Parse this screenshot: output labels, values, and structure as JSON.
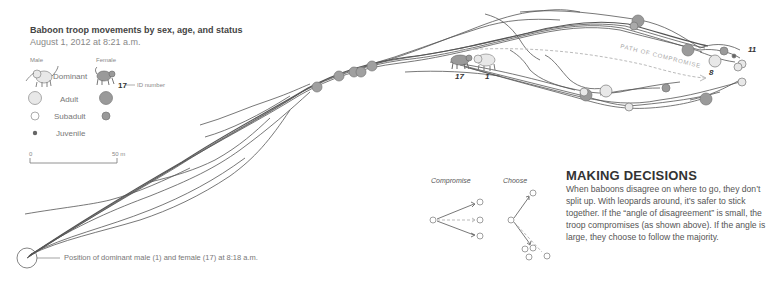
{
  "header": {
    "title": "Baboon troop movements by sex, age, and status",
    "subtitle": "August 1, 2012 at 8:21 a.m."
  },
  "legend": {
    "col_male": "Male",
    "col_female": "Female",
    "rows": [
      {
        "label": "Dominant",
        "male_icon": "baboon-male-icon",
        "female_icon": "baboon-female-icon"
      },
      {
        "label": "Adult",
        "male_icon": "large-light-circle",
        "female_icon": "large-dark-circle"
      },
      {
        "label": "Subadult",
        "male_icon": "small-light-circle",
        "female_icon": "small-dark-circle"
      },
      {
        "label": "Juvenile",
        "icon": "dot"
      }
    ],
    "id_example": "17",
    "id_label": "ID number",
    "scale_start": "0",
    "scale_end": "50 m"
  },
  "map": {
    "path_label": "PATH OF COMPROMISE",
    "start_annotation": "Position of dominant male (1) and female (17) at 8:18 a.m.",
    "ids": {
      "female_dominant": "17",
      "male_dominant": "1",
      "id_8": "8",
      "id_11": "11"
    },
    "colors": {
      "track": "#555555",
      "male_fill": "#e6e6e6",
      "female_fill": "#9a9a9a",
      "path_dash": "#bbbbbb"
    }
  },
  "decisions": {
    "compromise_label": "Compromise",
    "choose_label": "Choose",
    "heading": "MAKING DECISIONS",
    "body": "When baboons disagree on where to go, they don’t split up. With leopards around, it’s safer to stick together. If the “angle of disagreement” is small, the troop compromises (as shown above). If the angle is large, they choose to follow the majority."
  }
}
